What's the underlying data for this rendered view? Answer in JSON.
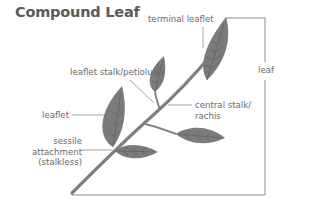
{
  "title": "Compound Leaf",
  "labels": {
    "terminal_leaflet": "terminal leaflet",
    "leaflet_stalk": "leaflet stalk/petiolule",
    "leaflet": "leaflet",
    "central_stalk_line1": "central stalk/",
    "central_stalk_line2": "rachis",
    "sessile_line1": "sessile",
    "sessile_line2": "attachment",
    "sessile_line3": "(stalkless)",
    "leaf": "leaf"
  },
  "colors": {
    "leaf_fill": "#7b7b7b",
    "vein": "#5e5e5e",
    "stalk": "#808080",
    "line": "#8a8a8a",
    "text": "#6a6a6a",
    "title": "#5a5a5a"
  }
}
